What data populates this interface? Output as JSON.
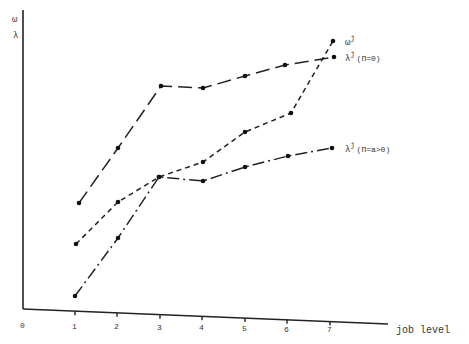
{
  "chart_data": {
    "type": "line",
    "title": "",
    "xlabel": "job level",
    "ylabel": "ω / λ",
    "y_axis_labels": [
      "ω",
      "λ"
    ],
    "x_ticks": [
      "0",
      "1",
      "2",
      "3",
      "4",
      "5",
      "6",
      "7"
    ],
    "x": [
      1,
      2,
      3,
      4,
      5,
      6,
      7
    ],
    "grid": false,
    "legend_position": "inline-right",
    "series": [
      {
        "name": "λʲ (Π=0)",
        "label_main": "λ",
        "label_sup": "j",
        "label_suffix": "(Π=0)",
        "style": "long-dash",
        "values": [
          0.36,
          0.55,
          0.77,
          0.76,
          0.8,
          0.84,
          0.86
        ]
      },
      {
        "name": "ωʲ",
        "label_main": "ω",
        "label_sup": "j",
        "label_suffix": "",
        "style": "short-dash",
        "values": [
          0.22,
          0.36,
          0.45,
          0.5,
          0.61,
          0.67,
          0.91
        ]
      },
      {
        "name": "λʲ (Π=a>0)",
        "label_main": "λ",
        "label_sup": "j",
        "label_suffix": "(Π=a>0)",
        "style": "long-dash-dot",
        "values": [
          0.02,
          0.24,
          0.45,
          0.43,
          0.48,
          0.52,
          0.55
        ]
      }
    ],
    "pixel_points": {
      "lambda_pi0": [
        [
          79,
          203
        ],
        [
          118,
          148
        ],
        [
          161,
          86
        ],
        [
          203,
          88
        ],
        [
          245,
          76
        ],
        [
          285,
          65
        ],
        [
          334,
          57
        ]
      ],
      "omega": [
        [
          76,
          244
        ],
        [
          118,
          202
        ],
        [
          159,
          177
        ],
        [
          203,
          162
        ],
        [
          245,
          132
        ],
        [
          291,
          113
        ],
        [
          333,
          41
        ]
      ],
      "lambda_pia": [
        [
          75,
          296
        ],
        [
          118,
          238
        ],
        [
          159,
          177
        ],
        [
          203,
          181
        ],
        [
          245,
          167
        ],
        [
          288,
          156
        ],
        [
          332,
          148
        ]
      ]
    }
  }
}
